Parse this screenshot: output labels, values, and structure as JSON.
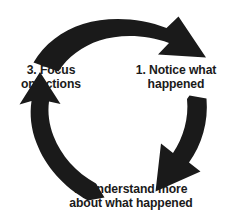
{
  "diagram": {
    "type": "circular-cycle-diagram",
    "background_color": "#ffffff",
    "arrow_color": "#1a1a1a",
    "text_color": "#1a1a1a",
    "steps": [
      {
        "number": "1.",
        "position": "right",
        "lines": [
          "1. Notice what",
          "happened"
        ]
      },
      {
        "number": "2.",
        "position": "bottom",
        "lines": [
          "2. Understand more",
          "about what happened"
        ]
      },
      {
        "number": "3.",
        "position": "left",
        "lines": [
          "3. Focus",
          "on actions"
        ]
      }
    ],
    "arrows": [
      {
        "name": "top-arrow",
        "from": "3. Focus on actions",
        "to": "1. Notice what happened",
        "direction": "clockwise"
      },
      {
        "name": "right-arrow",
        "from": "1. Notice what happened",
        "to": "2. Understand more about what happened",
        "direction": "clockwise"
      },
      {
        "name": "left-arrow",
        "from": "2. Understand more about what happened",
        "to": "3. Focus on actions",
        "direction": "clockwise"
      }
    ]
  },
  "labels": {
    "notice": {
      "line1": "1. Notice what",
      "line2": "happened"
    },
    "focus": {
      "line1": "3. Focus",
      "line2": "on actions"
    },
    "understand": {
      "line1": "2. Understand more",
      "line2": "about what happened"
    }
  }
}
